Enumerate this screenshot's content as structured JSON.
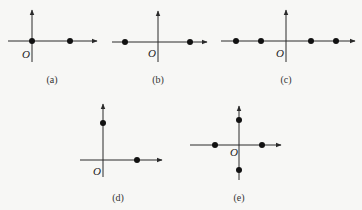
{
  "figures": [
    {
      "id": "a",
      "caption": "(a)",
      "origin_label": "O",
      "origin": [
        32,
        41
      ],
      "x_axis": {
        "x1": 8,
        "x2": 97
      },
      "y_axis": {
        "y1": 10,
        "y2": 62
      },
      "points": [
        [
          32,
          41
        ],
        [
          70,
          41
        ]
      ],
      "caption_pos": [
        52,
        83
      ],
      "origin_label_pos": [
        22,
        58
      ]
    },
    {
      "id": "b",
      "caption": "(b)",
      "origin_label": "O",
      "origin": [
        158,
        42
      ],
      "x_axis": {
        "x1": 112,
        "x2": 207
      },
      "y_axis": {
        "y1": 11,
        "y2": 62
      },
      "points": [
        [
          125,
          42
        ],
        [
          190,
          42
        ]
      ],
      "caption_pos": [
        158,
        83
      ],
      "origin_label_pos": [
        148,
        57
      ]
    },
    {
      "id": "c",
      "caption": "(c)",
      "origin_label": "O",
      "origin": [
        286,
        41
      ],
      "x_axis": {
        "x1": 221,
        "x2": 355
      },
      "y_axis": {
        "y1": 10,
        "y2": 62
      },
      "points": [
        [
          236,
          41
        ],
        [
          261,
          41
        ],
        [
          311,
          41
        ],
        [
          336,
          41
        ]
      ],
      "caption_pos": [
        286,
        83
      ],
      "origin_label_pos": [
        276,
        57
      ]
    },
    {
      "id": "d",
      "caption": "(d)",
      "origin_label": "O",
      "origin": [
        103,
        160
      ],
      "x_axis": {
        "x1": 80,
        "x2": 162
      },
      "y_axis": {
        "y1": 104,
        "y2": 177
      },
      "points": [
        [
          103,
          123
        ],
        [
          137,
          160
        ]
      ],
      "caption_pos": [
        118,
        201
      ],
      "origin_label_pos": [
        93,
        175
      ]
    },
    {
      "id": "e",
      "caption": "(e)",
      "origin_label": "O",
      "origin": [
        239,
        145
      ],
      "x_axis": {
        "x1": 190,
        "x2": 281
      },
      "y_axis": {
        "y1": 106,
        "y2": 180
      },
      "points": [
        [
          239,
          120
        ],
        [
          215,
          145
        ],
        [
          262,
          145
        ],
        [
          239,
          170
        ]
      ],
      "caption_pos": [
        239,
        201
      ],
      "origin_label_pos": [
        230,
        156
      ]
    }
  ],
  "style": {
    "axis_color": "#2a2a2a",
    "point_color": "#111111",
    "background": "#f7f7f5"
  }
}
